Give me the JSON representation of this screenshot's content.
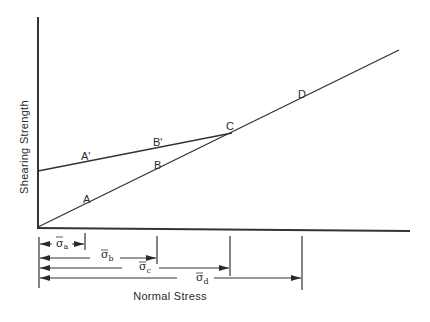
{
  "diagram": {
    "axes": {
      "y_label": "Shearing Strength",
      "x_label": "Normal Stress"
    },
    "lines": [
      {
        "name": "failure-envelope-through-origin",
        "points": [
          "A",
          "B",
          "C",
          "D"
        ]
      },
      {
        "name": "prestressed-envelope",
        "points": [
          "A'",
          "B'",
          "C"
        ]
      }
    ],
    "points": {
      "A": "A",
      "B": "B",
      "C": "C",
      "D": "D",
      "A_prime": "A'",
      "B_prime": "B'"
    },
    "stresses": [
      {
        "symbol": "σ",
        "sub": "a"
      },
      {
        "symbol": "σ",
        "sub": "b"
      },
      {
        "symbol": "σ",
        "sub": "c"
      },
      {
        "symbol": "σ",
        "sub": "d"
      }
    ],
    "colors": {
      "ink": "#2a2a2a",
      "background": "#ffffff"
    }
  }
}
